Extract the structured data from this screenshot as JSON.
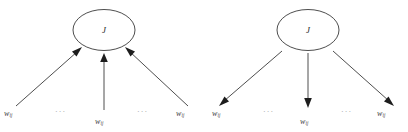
{
  "figure": {
    "name": "weight-flow-diagram-pair",
    "background_color": "#ffffff",
    "line_color": "#3a3a3a",
    "text_color": "#3d3d3d",
    "dots_color": "#9a9a9a",
    "width": 408,
    "height": 132
  },
  "panels": [
    {
      "id": "left",
      "direction": "inbound",
      "description": "three weight terms feeding into node J",
      "node": {
        "label": "J"
      },
      "edges": [
        {
          "id": "left-edge-1",
          "from": "w-ij-left",
          "to": "node-J",
          "arrow_at": "node"
        },
        {
          "id": "left-edge-2",
          "from": "w-ij-mid",
          "to": "node-J",
          "arrow_at": "node"
        },
        {
          "id": "left-edge-3",
          "from": "w-ij-right",
          "to": "node-J",
          "arrow_at": "node"
        }
      ],
      "labels": [
        {
          "id": "w-ij-left",
          "base": "w",
          "sub": "ij"
        },
        {
          "id": "w-ij-mid",
          "base": "w",
          "sub": "ij"
        },
        {
          "id": "w-ij-right",
          "base": "w",
          "sub": "ij"
        }
      ],
      "ellipses": [
        "···",
        "···"
      ]
    },
    {
      "id": "right",
      "direction": "outbound",
      "description": "node J distributing to three weight terms",
      "node": {
        "label": "J"
      },
      "edges": [
        {
          "id": "right-edge-1",
          "from": "node-J",
          "to": "w-ij-left",
          "arrow_at": "label"
        },
        {
          "id": "right-edge-2",
          "from": "node-J",
          "to": "w-ij-mid",
          "arrow_at": "label"
        },
        {
          "id": "right-edge-3",
          "from": "node-J",
          "to": "w-ij-right",
          "arrow_at": "label"
        }
      ],
      "labels": [
        {
          "id": "w-ij-left",
          "base": "w",
          "sub": "ij"
        },
        {
          "id": "w-ij-mid",
          "base": "w",
          "sub": "ij"
        },
        {
          "id": "w-ij-right",
          "base": "w",
          "sub": "ij"
        }
      ],
      "ellipses": [
        "···",
        "···"
      ]
    }
  ]
}
